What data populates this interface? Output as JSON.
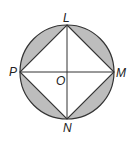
{
  "diagram": {
    "type": "circle-inscribed-square",
    "labels": {
      "top": "L",
      "left": "P",
      "right": "M",
      "bottom": "N",
      "center": "O"
    },
    "colors": {
      "stroke": "#333333",
      "shaded": "#bdbdbd",
      "background": "#ffffff"
    },
    "geometry": {
      "center": [
        67,
        72
      ],
      "radius": 47
    },
    "shaded_regions": [
      "segment-PL",
      "segment-LM",
      "segment-MN",
      "segment-NP"
    ]
  }
}
